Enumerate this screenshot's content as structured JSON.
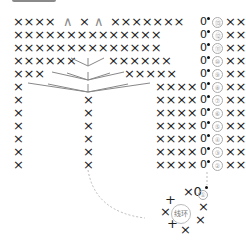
{
  "stitch_symbols": {
    "single_crochet": "×",
    "increase": "∧",
    "chain": "0",
    "slip_stitch": "•",
    "magic_ring": "线环"
  },
  "rows": [
    {
      "num": "⑬",
      "left": "××××",
      "mid_a": "∧",
      "mid_b": "×",
      "mid_c": "∧",
      "right": "×××××××",
      "tail": "××"
    },
    {
      "num": "⑫",
      "left": "××××××××××××××",
      "right": "",
      "tail": "××"
    },
    {
      "num": "⑪",
      "left": "××××××××××××××",
      "right": "",
      "tail": "××"
    },
    {
      "num": "⑩",
      "left": "××××××",
      "right": "××××××",
      "tail": "××"
    },
    {
      "num": "⑨",
      "left": "×××",
      "right": "×××××",
      "tail": "××"
    },
    {
      "num": "⑧",
      "left": "×",
      "right": "××××",
      "tail": "××"
    },
    {
      "num": "⑦",
      "left": "×",
      "center": "×",
      "right": "××××",
      "tail": "××"
    },
    {
      "num": "⑥",
      "left": "×",
      "center": "×",
      "right": "××××",
      "tail": "××"
    },
    {
      "num": "⑤",
      "left": "×",
      "center": "×",
      "right": "××××",
      "tail": "××"
    },
    {
      "num": "④",
      "left": "×",
      "center": "×",
      "right": "××××",
      "tail": "××"
    },
    {
      "num": "③",
      "left": "×",
      "center": "×",
      "right": "××××",
      "tail": "××"
    },
    {
      "num": "②",
      "left": "×",
      "center": "×",
      "right": "××××",
      "tail": "××"
    }
  ],
  "round1": {
    "num": "①",
    "label": "线环",
    "top": "×0"
  },
  "colors": {
    "ink": "#222222",
    "fan_lines": "#888888",
    "dashed": "#bbbbbb",
    "number_circle": "#aaaaaa"
  }
}
